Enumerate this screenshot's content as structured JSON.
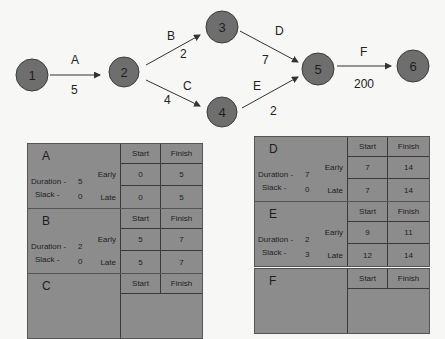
{
  "network": {
    "nodes": [
      {
        "id": "1",
        "cx": 32,
        "cy": 75,
        "r": 16
      },
      {
        "id": "2",
        "cx": 124,
        "cy": 72,
        "r": 15
      },
      {
        "id": "3",
        "cx": 222,
        "cy": 27,
        "r": 16
      },
      {
        "id": "4",
        "cx": 222,
        "cy": 112,
        "r": 15
      },
      {
        "id": "5",
        "cx": 318,
        "cy": 69,
        "r": 16
      },
      {
        "id": "6",
        "cx": 413,
        "cy": 66,
        "r": 16
      }
    ],
    "edges": [
      {
        "activity": "A",
        "duration": "5",
        "from": "1",
        "to": "2"
      },
      {
        "activity": "B",
        "duration": "2",
        "from": "2",
        "to": "3"
      },
      {
        "activity": "C",
        "duration": "4",
        "from": "2",
        "to": "4"
      },
      {
        "activity": "D",
        "duration": "7",
        "from": "3",
        "to": "5"
      },
      {
        "activity": "E",
        "duration": "2",
        "from": "4",
        "to": "5"
      },
      {
        "activity": "F",
        "duration": "200",
        "from": "5",
        "to": "6"
      }
    ],
    "colors": {
      "node_fill": "#6e6e6e",
      "node_stroke": "#3c3c3c",
      "edge": "#333333",
      "table_fill": "#8c8c8c"
    }
  },
  "table_labels": {
    "start": "Start",
    "finish": "Finish",
    "early": "Early",
    "late": "Late",
    "duration": "Duration -",
    "slack": "Slack -"
  },
  "tables": {
    "A": {
      "name": "A",
      "duration": "5",
      "slack": "0",
      "early_start": "0",
      "early_finish": "5",
      "late_start": "0",
      "late_finish": "5"
    },
    "B": {
      "name": "B",
      "duration": "2",
      "slack": "0",
      "early_start": "5",
      "early_finish": "7",
      "late_start": "5",
      "late_finish": "7"
    },
    "C": {
      "name": "C",
      "duration": "",
      "slack": "",
      "early_start": "",
      "early_finish": "",
      "late_start": "",
      "late_finish": ""
    },
    "D": {
      "name": "D",
      "duration": "7",
      "slack": "0",
      "early_start": "7",
      "early_finish": "14",
      "late_start": "7",
      "late_finish": "14"
    },
    "E": {
      "name": "E",
      "duration": "2",
      "slack": "3",
      "early_start": "9",
      "early_finish": "11",
      "late_start": "12",
      "late_finish": "14"
    },
    "F": {
      "name": "F",
      "duration": "",
      "slack": "",
      "early_start": "",
      "early_finish": "",
      "late_start": "",
      "late_finish": ""
    }
  }
}
